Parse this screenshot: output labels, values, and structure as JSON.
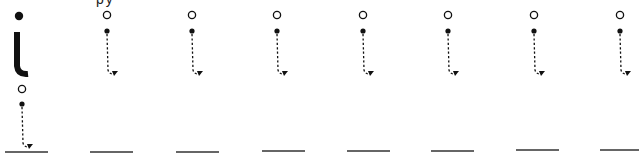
{
  "worksheet": {
    "top_text_fragment": "py",
    "letter": "i",
    "model_letter": {
      "x": 19,
      "dot_y": 16,
      "stem_top": 32,
      "stem_bottom": 70,
      "hook_end_x": 28,
      "hook_end_y": 75
    },
    "trace_row1": {
      "columns_x": [
        107,
        192,
        277,
        363,
        448,
        534,
        620
      ],
      "start_circle_y": 15,
      "dot_y": 31,
      "line_bottom_y": 70,
      "arrow_y": 74
    },
    "trace_row2": {
      "x": 22,
      "start_circle_y": 89,
      "dot_y": 104,
      "line_bottom_y": 143,
      "arrow_y": 147
    },
    "baselines": [
      {
        "x1": 5,
        "x2": 48,
        "y": 152
      },
      {
        "x1": 90,
        "x2": 133,
        "y": 152
      },
      {
        "x1": 176,
        "x2": 219,
        "y": 152
      },
      {
        "x1": 262,
        "x2": 305,
        "y": 151
      },
      {
        "x1": 347,
        "x2": 390,
        "y": 151
      },
      {
        "x1": 431,
        "x2": 474,
        "y": 151
      },
      {
        "x1": 516,
        "x2": 559,
        "y": 150
      },
      {
        "x1": 600,
        "x2": 639,
        "y": 150
      }
    ],
    "colors": {
      "ink": "#111111",
      "baseline": "#333333",
      "background": "#ffffff"
    }
  }
}
